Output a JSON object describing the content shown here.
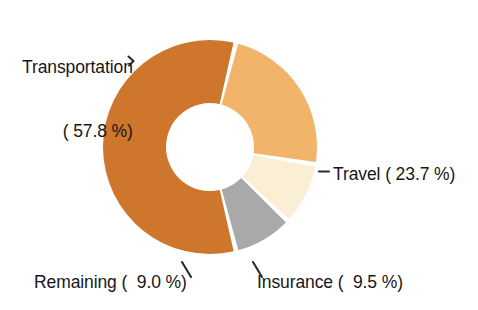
{
  "chart_data": {
    "type": "pie",
    "variant": "donut",
    "title": "",
    "subtitle": "",
    "xlabel": "",
    "ylabel": "",
    "legend_position": "none",
    "grid": false,
    "units": "percent",
    "value_suffix": "%",
    "total": 100.0,
    "categories": [
      "Transportation",
      "Travel",
      "Insurance",
      "Remaining"
    ],
    "values": [
      57.8,
      23.7,
      9.5,
      9.0
    ],
    "colors": [
      "#CE762C",
      "#F2B46B",
      "#FAEFD5",
      "#A9A9A9"
    ],
    "slices": [
      {
        "name": "Transportation",
        "value": 57.8,
        "value_text": "57.8",
        "color": "#CE762C",
        "start_angle": 154.8,
        "end_angle": 363.0,
        "label_text": "Transportation",
        "label_value_text": "( 57.8 %)"
      },
      {
        "name": "Travel",
        "value": 23.7,
        "value_text": "23.7",
        "color": "#F2B46B",
        "start_angle": 14.0,
        "end_angle": 99.3,
        "label_text": "Travel ( 23.7 %)"
      },
      {
        "name": "Insurance",
        "value": 9.5,
        "value_text": "9.5",
        "color": "#FAEFD5",
        "start_angle": 99.3,
        "end_angle": 133.5,
        "label_text": "Insurance (  9.5 %)"
      },
      {
        "name": "Remaining",
        "value": 9.0,
        "value_text": "9.0",
        "color": "#A9A9A9",
        "start_angle": 133.5,
        "end_angle": 166.0,
        "label_text": "Remaining (  9.0 %)"
      }
    ],
    "geometry": {
      "center_x": 210,
      "center_y": 147,
      "outer_radius": 107,
      "inner_radius": 44,
      "start_offset_deg": 14,
      "gap_deg": 2.6,
      "direction": "clockwise"
    }
  },
  "labels": {
    "transportation": {
      "line1": "Transportation",
      "line2": "( 57.8 %)"
    },
    "travel": {
      "text": "Travel ( 23.7 %)"
    },
    "insurance": {
      "text": "Insurance (  9.5 %)"
    },
    "remaining": {
      "text": "Remaining (  9.0 %)"
    }
  },
  "style": {
    "background": "#ffffff",
    "text_color": "#171717",
    "leader_color": "#2a2a2a"
  }
}
